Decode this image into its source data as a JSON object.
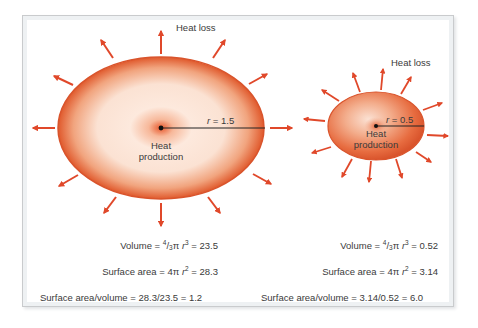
{
  "colors": {
    "arrow": "#e0482a",
    "ellipse_edge": "#d9542c",
    "ellipse_center": "#fff3ea",
    "frame_border": "#c9cbcd",
    "text": "#3a3a3a"
  },
  "large_cell": {
    "heat_loss_label": "Heat loss",
    "radius_label_var": "r",
    "radius_label_value": " = 1.5",
    "center_label_line1": "Heat",
    "center_label_line2": "production",
    "volume": {
      "prefix": "Volume = ",
      "frac_num": "4",
      "frac_sep": "/",
      "frac_den": "3",
      "pi": "π ",
      "var": "r",
      "exp": "3",
      "result": " = 23.5"
    },
    "surface_area": {
      "prefix": "Surface area = 4π ",
      "var": "r",
      "exp": "2",
      "result": " = 28.3"
    },
    "ratio": "Surface area/volume = 28.3/23.5 = 1.2"
  },
  "small_cell": {
    "heat_loss_label": "Heat loss",
    "radius_label_var": "r",
    "radius_label_value": " = 0.5",
    "center_label_line1": "Heat",
    "center_label_line2": "production",
    "volume": {
      "prefix": "Volume = ",
      "frac_num": "4",
      "frac_sep": "/",
      "frac_den": "3",
      "pi": "π ",
      "var": "r",
      "exp": "3",
      "result": " = 0.52"
    },
    "surface_area": {
      "prefix": "Surface area = 4π ",
      "var": "r",
      "exp": "2",
      "result": " = 3.14"
    },
    "ratio": "Surface area/volume = 3.14/0.52 = 6.0"
  }
}
